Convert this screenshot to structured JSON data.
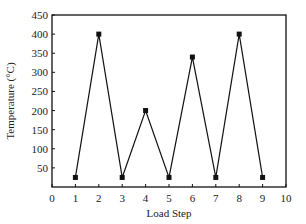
{
  "chart_data": {
    "type": "line",
    "title": "",
    "xlabel": "Load Step",
    "ylabel": "Temperature (°C)",
    "x": [
      1,
      2,
      3,
      4,
      5,
      6,
      7,
      8,
      9
    ],
    "series": [
      {
        "name": "Temperature",
        "values": [
          25,
          400,
          25,
          200,
          25,
          340,
          25,
          400,
          25
        ],
        "marker": "square",
        "color": "#111111"
      }
    ],
    "xlim": [
      0,
      10
    ],
    "ylim": [
      0,
      450
    ],
    "xticks": [
      "0",
      "1",
      "2",
      "3",
      "4",
      "5",
      "6",
      "7",
      "8",
      "9",
      "10"
    ],
    "yticks": [
      "50",
      "100",
      "150",
      "200",
      "250",
      "300",
      "350",
      "400",
      "450"
    ],
    "grid": false,
    "legend": false
  }
}
